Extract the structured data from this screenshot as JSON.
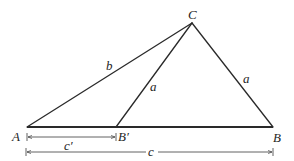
{
  "diagram": {
    "points": {
      "A": {
        "label": "A",
        "x": 27,
        "y": 127
      },
      "B_prime": {
        "label": "B′",
        "x": 116,
        "y": 127
      },
      "B": {
        "label": "B",
        "x": 273,
        "y": 127
      },
      "C": {
        "label": "C",
        "x": 192,
        "y": 23
      }
    },
    "segments": [
      {
        "from": "A",
        "to": "C",
        "label": "b"
      },
      {
        "from": "B_prime",
        "to": "C",
        "label": "a"
      },
      {
        "from": "C",
        "to": "B",
        "label": "a"
      },
      {
        "from": "A",
        "to": "B",
        "label": ""
      }
    ],
    "dimensions": [
      {
        "from": "A",
        "to": "B_prime",
        "label": "c′"
      },
      {
        "from": "A",
        "to": "B",
        "label": "c"
      }
    ],
    "colors": {
      "line": "#2a2a2a",
      "text": "#1e1e1e",
      "background": "#ffffff"
    }
  }
}
